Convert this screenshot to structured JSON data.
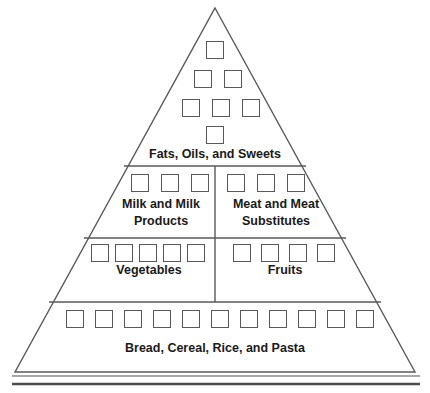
{
  "diagram": {
    "shape": "triangle",
    "background_color": "#ffffff",
    "line_color": "#595959",
    "text_color": "#1a1a1a",
    "apex": {
      "x": 215,
      "y": 8
    },
    "base_left": {
      "x": 15,
      "y": 372
    },
    "base_right": {
      "x": 415,
      "y": 372
    },
    "divider_y": [
      166,
      238,
      302
    ],
    "vertical_divider_x": 215,
    "baseline_rules": [
      {
        "y": 376,
        "thickness": 1.4
      },
      {
        "y": 384,
        "thickness": 2.6
      }
    ]
  },
  "tiers": [
    {
      "id": "tier-fats",
      "name": "fats-oils-sweets",
      "label": "Fats, Oils, and Sweets",
      "serving_squares": 7,
      "square_rows": [
        1,
        2,
        3,
        1
      ],
      "label_x": 215,
      "label_y": 146,
      "squares": [
        {
          "x": 206,
          "y": 41
        },
        {
          "x": 194,
          "y": 70
        },
        {
          "x": 224,
          "y": 70
        },
        {
          "x": 182,
          "y": 99
        },
        {
          "x": 212,
          "y": 99
        },
        {
          "x": 242,
          "y": 99
        },
        {
          "x": 206,
          "y": 126
        }
      ]
    },
    {
      "id": "tier-milk",
      "name": "milk-and-milk-products",
      "label": "Milk and Milk Products",
      "serving_squares": 3,
      "label_x": 161,
      "label_y": 196,
      "label_width": 108,
      "squares": [
        {
          "x": 131,
          "y": 174
        },
        {
          "x": 161,
          "y": 174
        },
        {
          "x": 191,
          "y": 174
        }
      ]
    },
    {
      "id": "tier-meat",
      "name": "meat-and-meat-substitutes",
      "label": "Meat and Meat Substitutes",
      "serving_squares": 3,
      "label_x": 268,
      "label_y": 196,
      "label_width": 116,
      "squares": [
        {
          "x": 227,
          "y": 174
        },
        {
          "x": 257,
          "y": 174
        },
        {
          "x": 287,
          "y": 174
        }
      ]
    },
    {
      "id": "tier-vegetables",
      "name": "vegetables",
      "label": "Vegetables",
      "serving_squares": 5,
      "label_x": 149,
      "label_y": 262,
      "squares": [
        {
          "x": 91,
          "y": 244
        },
        {
          "x": 113,
          "y": 244
        },
        {
          "x": 137,
          "y": 244
        },
        {
          "x": 161,
          "y": 244
        },
        {
          "x": 187,
          "y": 244
        }
      ]
    },
    {
      "id": "tier-fruits",
      "name": "fruits",
      "label": "Fruits",
      "serving_squares": 4,
      "label_x": 285,
      "label_y": 262,
      "squares": [
        {
          "x": 233,
          "y": 244
        },
        {
          "x": 261,
          "y": 244
        },
        {
          "x": 288,
          "y": 244
        },
        {
          "x": 315,
          "y": 244
        }
      ]
    },
    {
      "id": "tier-bread",
      "name": "bread-cereal-rice-pasta",
      "label": "Bread, Cereal, Rice, and Pasta",
      "serving_squares": 11,
      "label_x": 215,
      "label_y": 340,
      "squares": [
        {
          "x": 66,
          "y": 310
        },
        {
          "x": 95,
          "y": 310
        },
        {
          "x": 124,
          "y": 310
        },
        {
          "x": 153,
          "y": 310
        },
        {
          "x": 182,
          "y": 310
        },
        {
          "x": 211,
          "y": 310
        },
        {
          "x": 240,
          "y": 310
        },
        {
          "x": 269,
          "y": 310
        },
        {
          "x": 298,
          "y": 310
        },
        {
          "x": 327,
          "y": 310
        },
        {
          "x": 356,
          "y": 310
        }
      ]
    }
  ]
}
